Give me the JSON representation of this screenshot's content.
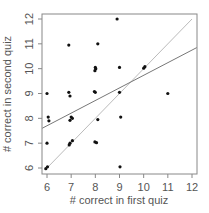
{
  "chart_data": {
    "type": "scatter",
    "title": "",
    "xlabel": "# correct in first quiz",
    "ylabel": "# correct in second quiz",
    "xlim": [
      5.8,
      12.2
    ],
    "ylim": [
      5.8,
      12.2
    ],
    "xticks": [
      6,
      7,
      8,
      9,
      10,
      11,
      12
    ],
    "yticks": [
      6,
      7,
      8,
      9,
      10,
      11,
      12
    ],
    "grid": false,
    "legend": null,
    "series": [
      {
        "name": "quiz scores (jittered)",
        "points": [
          [
            6.0,
            9.0
          ],
          [
            6.05,
            8.05
          ],
          [
            6.08,
            7.9
          ],
          [
            6.0,
            7.0
          ],
          [
            5.95,
            5.97
          ],
          [
            6.02,
            6.05
          ],
          [
            6.9,
            10.95
          ],
          [
            6.9,
            9.05
          ],
          [
            6.95,
            8.9
          ],
          [
            7.0,
            8.05
          ],
          [
            7.05,
            8.0
          ],
          [
            6.95,
            7.92
          ],
          [
            6.95,
            7.0
          ],
          [
            7.05,
            7.1
          ],
          [
            6.92,
            6.93
          ],
          [
            8.1,
            11.0
          ],
          [
            8.0,
            10.05
          ],
          [
            7.98,
            9.92
          ],
          [
            8.02,
            10.0
          ],
          [
            8.0,
            9.05
          ],
          [
            7.96,
            9.08
          ],
          [
            8.1,
            7.95
          ],
          [
            7.98,
            7.05
          ],
          [
            8.05,
            7.02
          ],
          [
            8.9,
            12.0
          ],
          [
            9.0,
            10.05
          ],
          [
            9.0,
            9.05
          ],
          [
            9.05,
            8.05
          ],
          [
            9.02,
            6.05
          ],
          [
            10.0,
            10.02
          ],
          [
            10.05,
            10.08
          ],
          [
            11.0,
            9.0
          ]
        ]
      }
    ],
    "lines": [
      {
        "name": "y = x reference",
        "color": "#bbbbbb",
        "from": [
          6,
          6
        ],
        "to": [
          12,
          12
        ]
      },
      {
        "name": "regression fit",
        "color": "#777777",
        "from": [
          5.8,
          7.6
        ],
        "to": [
          12.2,
          10.85
        ]
      }
    ]
  },
  "colors": {
    "point": "#111111",
    "frame": "#888888",
    "text": "#555555"
  }
}
